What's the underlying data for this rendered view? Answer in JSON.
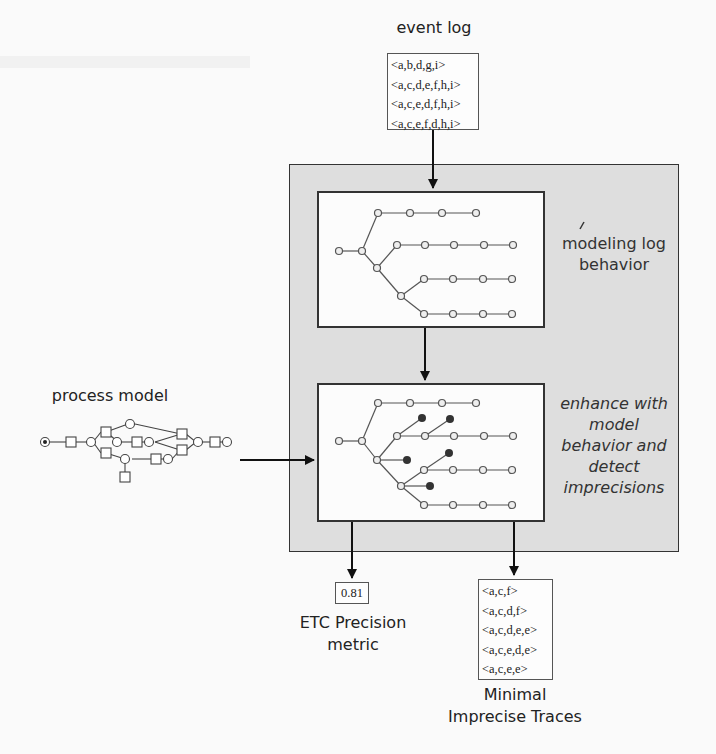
{
  "figure": {
    "event_log": {
      "title": "event log",
      "traces": [
        "<a,b,d,g,i>",
        "<a,c,d,e,f,h,i>",
        "<a,c,e,d,f,h,i>",
        "<a,c,e,f,d,h,i>"
      ]
    },
    "process_model": {
      "title": "process model",
      "places": [
        "start",
        "p1",
        "p2",
        "p3",
        "p4",
        "p5",
        "p6",
        "p7",
        "p8",
        "end"
      ],
      "transitions": [
        {
          "id": "t1",
          "label": "a"
        },
        {
          "id": "t2",
          "label": "b"
        },
        {
          "id": "t3",
          "label": "c"
        },
        {
          "id": "t4",
          "label": "d"
        },
        {
          "id": "t5",
          "label": "e"
        },
        {
          "id": "t6",
          "label": "f"
        },
        {
          "id": "t7",
          "label": "g"
        },
        {
          "id": "t8",
          "label": "h"
        },
        {
          "id": "t9",
          "label": "i"
        }
      ]
    },
    "stages": [
      {
        "label": "modeling log behavior"
      },
      {
        "label": "enhance with model behavior and detect imprecisions"
      }
    ],
    "outputs": {
      "metric": {
        "value": "0.81",
        "label_line1": "ETC Precision",
        "label_line2": "metric"
      },
      "imprecise_traces": {
        "label_line1": "Minimal",
        "label_line2": "Imprecise Traces",
        "traces": [
          "<a,c,f>",
          "<a,c,d,f>",
          "<a,c,d,e,e>",
          "<a,c,e,d,e>",
          "<a,c,e,e>"
        ]
      }
    }
  }
}
